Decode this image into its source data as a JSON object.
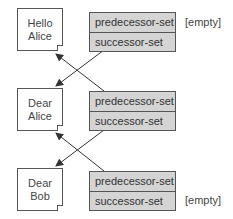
{
  "documents": [
    {
      "line1": "Hello",
      "line2": "Alice"
    },
    {
      "line1": "Dear",
      "line2": "Alice"
    },
    {
      "line1": "Dear",
      "line2": "Bob"
    }
  ],
  "sets": [
    {
      "predecessor_label": "predecessor-set",
      "successor_label": "successor-set",
      "predecessor_note": "[empty]",
      "successor_note": ""
    },
    {
      "predecessor_label": "predecessor-set",
      "successor_label": "successor-set",
      "predecessor_note": "",
      "successor_note": ""
    },
    {
      "predecessor_label": "predecessor-set",
      "successor_label": "successor-set",
      "predecessor_note": "",
      "successor_note": "[empty]"
    }
  ],
  "colors": {
    "set_fill": "#d4d4d4",
    "stroke": "#555555",
    "arrow": "#333333"
  },
  "caption": {
    "text": ""
  }
}
